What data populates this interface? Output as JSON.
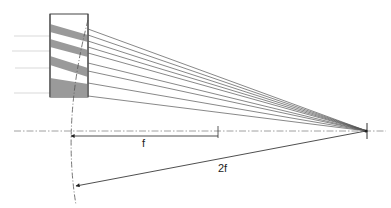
{
  "diagram": {
    "type": "optics",
    "labels": {
      "focal_length": "f",
      "double_focal_length": "2f"
    },
    "colors": {
      "line": "#555555",
      "band": "#9a9a9a",
      "axis": "#777777",
      "incoming": "#c8c8c8",
      "frame": "#444444"
    },
    "element": {
      "x": 50,
      "y": 14,
      "width": 38,
      "height": 83,
      "bands": [
        {
          "y_left": 26,
          "y_right": 36,
          "thickness": 8
        },
        {
          "y_left": 41,
          "y_right": 52,
          "thickness": 8
        },
        {
          "y_left": 58,
          "y_right": 70,
          "thickness": 9
        },
        {
          "y_left": 80,
          "y_right": 84,
          "thickness": 13
        }
      ]
    },
    "focal_point": {
      "x": 367,
      "y": 131
    },
    "axis_y": 131,
    "rays_start_y": [
      29,
      35,
      41,
      47,
      53,
      63,
      71,
      83,
      96
    ],
    "incoming_rays_y": [
      36,
      51,
      68,
      93
    ],
    "f_marker_x": 218,
    "arc_points": {
      "start": [
        88,
        20
      ],
      "mid": [
        70,
        130
      ],
      "end": [
        76,
        205
      ]
    }
  }
}
